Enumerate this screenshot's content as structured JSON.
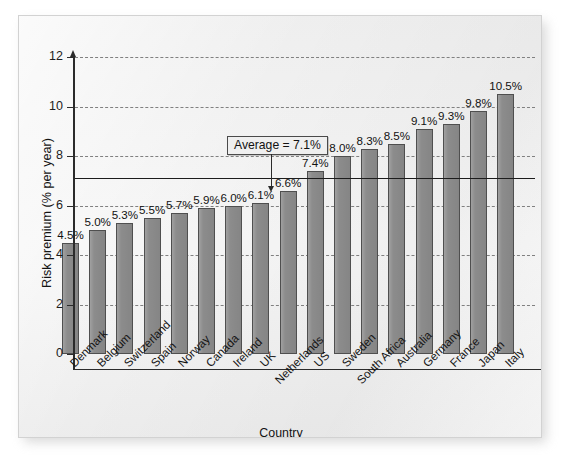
{
  "figure": {
    "x_axis_title": "Country",
    "y_axis_title": "Risk premium (% per year)",
    "average_callout": "Average = 7.1%",
    "colors": {
      "bar_fill": "#8c8c8c",
      "bar_stroke": "#4f4f4f",
      "axis": "#2b2b2b",
      "gridline": "#808080",
      "panel_background": "#f1f1f1"
    }
  },
  "chart_data": {
    "type": "bar",
    "title": "",
    "subtitle": "",
    "xlabel": "Country",
    "ylabel": "Risk premium (% per year)",
    "ylim": [
      0,
      12
    ],
    "yticks": [
      0,
      2,
      4,
      6,
      8,
      10,
      12
    ],
    "ytick_labels": [
      "0",
      "2",
      "4",
      "6",
      "8",
      "10",
      "12"
    ],
    "grid": "horizontal-dashed",
    "legend": "none",
    "categories": [
      "Denmark",
      "Belgium",
      "Switzerland",
      "Spain",
      "Norway",
      "Canada",
      "Ireland",
      "UK",
      "Netherlands",
      "US",
      "Sweden",
      "South Africa",
      "Australia",
      "Germany",
      "France",
      "Japan",
      "Italy"
    ],
    "values": [
      4.5,
      5.0,
      5.3,
      5.5,
      5.7,
      5.9,
      6.0,
      6.1,
      6.6,
      7.4,
      8.0,
      8.3,
      8.5,
      9.1,
      9.3,
      9.8,
      10.5
    ],
    "data_labels": [
      "4.5%",
      "5.0%",
      "5.3%",
      "5.5%",
      "5.7%",
      "5.9%",
      "6.0%",
      "6.1%",
      "6.6%",
      "7.4%",
      "8.0%",
      "8.3%",
      "8.5%",
      "9.1%",
      "9.3%",
      "9.8%",
      "10.5%"
    ],
    "annotations": [
      {
        "label": "Average = 7.1%",
        "value": 7.1,
        "kind": "horizontal-reference-line-with-callout"
      }
    ]
  }
}
